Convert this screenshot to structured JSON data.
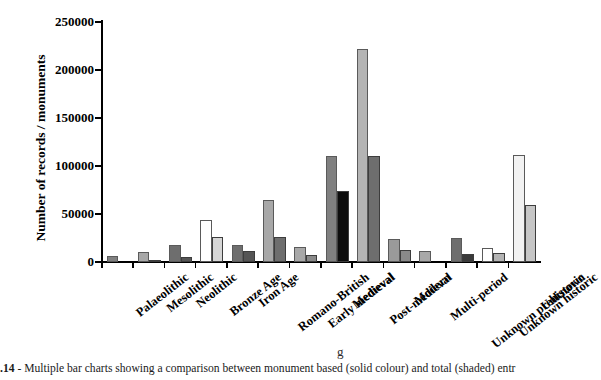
{
  "figure": {
    "caption_number": ".14",
    "caption_separator": " - ",
    "caption_text": "Multiple bar charts showing a comparison between monument based (solid colour) and total (shaded) entr",
    "caption_artifact": "g"
  },
  "chart_data": {
    "type": "bar",
    "title": "",
    "xlabel": "",
    "ylabel": "Number of records / monuments",
    "ylim": [
      0,
      250000
    ],
    "ytick_labels": [
      "0",
      "50000",
      "100000",
      "150000",
      "200000",
      "250000"
    ],
    "ytick_values": [
      0,
      50000,
      100000,
      150000,
      200000,
      250000
    ],
    "grid": false,
    "legend_position": "none",
    "categories": [
      "Palaeolithic",
      "Mesolithic",
      "Neolithic",
      "Bronze Age",
      "Iron Age",
      "Romano-British",
      "Early medieval",
      "Medieval",
      "Post-medieval",
      "Modern",
      "Multi-period",
      "Unknown prehistoric",
      "Unknown historic",
      "Unknown"
    ],
    "series": [
      {
        "name": "total (shaded)",
        "values": [
          6000,
          10000,
          18000,
          44000,
          18000,
          65000,
          16000,
          110000,
          222000,
          24000,
          11000,
          25000,
          15000,
          111000
        ]
      },
      {
        "name": "monument based (solid colour)",
        "values": [
          null,
          2500,
          5000,
          26000,
          11000,
          26000,
          7000,
          74000,
          110000,
          13000,
          null,
          8000,
          9000,
          59000
        ]
      }
    ],
    "bar_colors": {
      "total": [
        "#808080",
        "#a8a8a8",
        "#6e6e6e",
        "#ffffff",
        "#6e6e6e",
        "#a8a8a8",
        "#a8a8a8",
        "#808080",
        "#b4b4b4",
        "#9a9a9a",
        "#a8a8a8",
        "#6e6e6e",
        "#ffffff",
        "#f2f2f2"
      ],
      "monument": [
        "#808080",
        "#6e6e6e",
        "#555555",
        "#d6d6d6",
        "#555555",
        "#6e6e6e",
        "#8a8a8a",
        "#0d0d0d",
        "#6e6e6e",
        "#8a8a8a",
        "#a8a8a8",
        "#3a3a3a",
        "#b4b4b4",
        "#c6c6c6"
      ]
    },
    "axis_color": "#000000"
  }
}
